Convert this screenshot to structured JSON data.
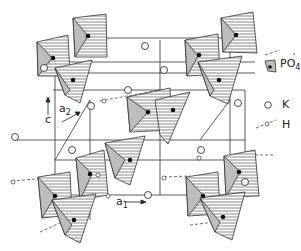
{
  "diagram": {
    "type": "crystal-structure",
    "axes": {
      "c": {
        "label": "c"
      },
      "a2": {
        "label": "a",
        "sub": "2"
      },
      "a1": {
        "label": "a",
        "sub": "1"
      }
    },
    "legend": [
      {
        "symbol": "shaded-tetrahedron-with-dot",
        "label": "PO",
        "sub": "4"
      },
      {
        "symbol": "open-circle",
        "label": "K"
      },
      {
        "symbol": "small-circle-on-dashed-line",
        "label": "H"
      }
    ],
    "colors": {
      "line": "#333333",
      "hatch": "#555555",
      "shade": "#bdbdbd",
      "background": "#ffffff"
    }
  }
}
